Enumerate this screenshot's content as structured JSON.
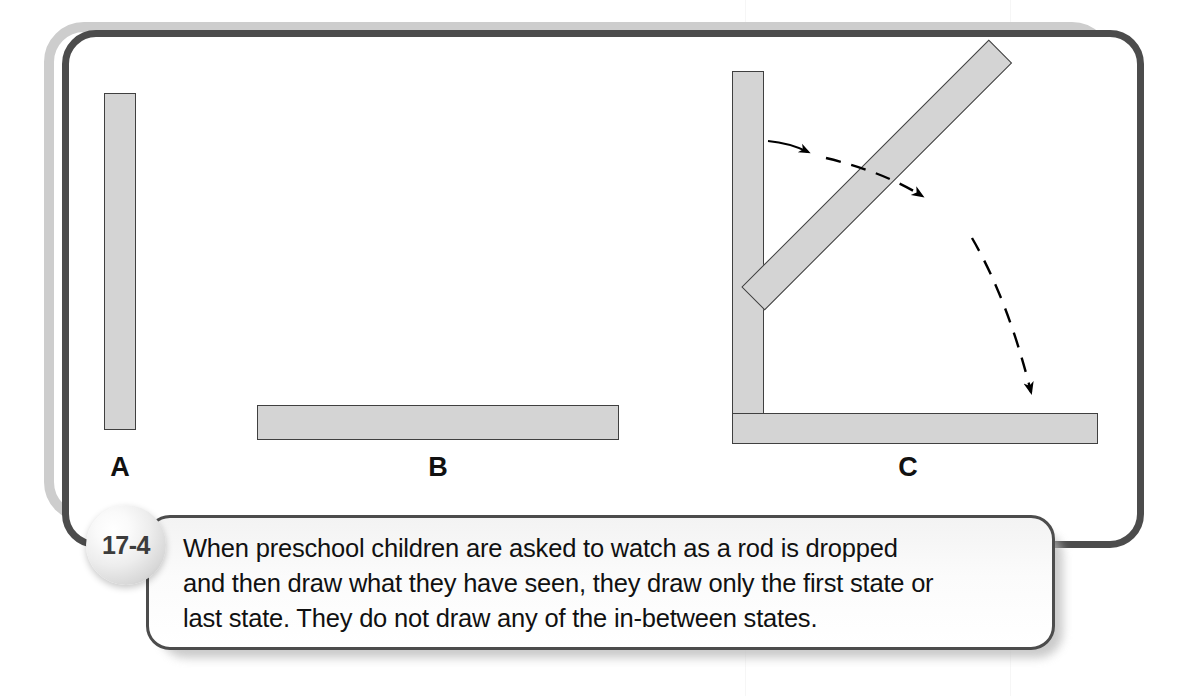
{
  "figure": {
    "number": "17-4",
    "caption": "When preschool children are asked to watch as a rod is dropped and then draw what they have seen, they draw only the first state or last state. They do not draw any of the in-between states.",
    "caption_lines": [
      "When preschool children are asked to watch as a rod is dropped",
      "and then draw what they have seen, they draw only the first state or",
      "last state. They do not draw any of the in-between states."
    ]
  },
  "panels": [
    {
      "label": "A",
      "description": "Vertical rod in upright first state",
      "rods": [
        {
          "name": "rod-a-vertical",
          "orientation": "vertical",
          "angle_deg": 90
        }
      ]
    },
    {
      "label": "B",
      "description": "Horizontal rod in fallen last state",
      "rods": [
        {
          "name": "rod-b-horizontal",
          "orientation": "horizontal",
          "angle_deg": 0
        }
      ]
    },
    {
      "label": "C",
      "description": "Rod shown falling through in-between states with motion arrows",
      "rods": [
        {
          "name": "rod-c-vertical",
          "orientation": "vertical",
          "angle_deg": 90
        },
        {
          "name": "rod-c-diagonal",
          "orientation": "diagonal",
          "angle_deg": 45
        },
        {
          "name": "rod-c-horizontal",
          "orientation": "horizontal",
          "angle_deg": 0
        }
      ],
      "arrows": [
        {
          "name": "motion-arrow-upper",
          "style": "dashed-curved",
          "heads": 2,
          "direction": "vertical-to-diagonal"
        },
        {
          "name": "motion-arrow-lower",
          "style": "dashed-curved",
          "heads": 1,
          "direction": "diagonal-to-horizontal"
        }
      ]
    }
  ],
  "colors": {
    "rod_fill": "#d4d4d4",
    "rod_border": "#404040",
    "frame_border": "#4c4c4c",
    "frame_shadow": "#cdcdcd",
    "text": "#111111",
    "badge_text": "#3c3c3c",
    "arrow": "#000000"
  }
}
